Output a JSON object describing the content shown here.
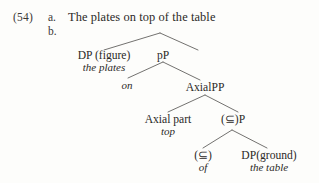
{
  "example": {
    "number": "(54)",
    "items": [
      {
        "label": "a.",
        "text": "The plates on top of the table"
      },
      {
        "label": "b.",
        "text": ""
      }
    ]
  },
  "tree": {
    "nodes": [
      {
        "name": "dp-figure",
        "label": "DP (figure)",
        "gloss": "the plates"
      },
      {
        "name": "pp-small",
        "label": "pP",
        "gloss": ""
      },
      {
        "name": "p-head-on",
        "label": "",
        "gloss": "on"
      },
      {
        "name": "axialpp",
        "label": "AxialPP",
        "gloss": ""
      },
      {
        "name": "axial-part",
        "label": "Axial part",
        "gloss": "top"
      },
      {
        "name": "subset-p",
        "label": "(⊆)P",
        "gloss": ""
      },
      {
        "name": "subset-head",
        "label": "(⊆)",
        "gloss": "of"
      },
      {
        "name": "dp-ground",
        "label": "DP(ground)",
        "gloss": "the table"
      }
    ],
    "edges": [
      {
        "from": "root-apex",
        "to": "dp-figure"
      },
      {
        "from": "root-apex",
        "to": "pp-small"
      },
      {
        "from": "pp-small",
        "to": "p-head-on"
      },
      {
        "from": "pp-small",
        "to": "axialpp"
      },
      {
        "from": "axialpp",
        "to": "axial-part"
      },
      {
        "from": "axialpp",
        "to": "subset-p"
      },
      {
        "from": "subset-p",
        "to": "subset-head"
      },
      {
        "from": "subset-p",
        "to": "dp-ground"
      }
    ]
  },
  "colors": {
    "page_background": "#fdfdfb",
    "ink": "#2b2927",
    "branch_line": "#5a5856"
  }
}
